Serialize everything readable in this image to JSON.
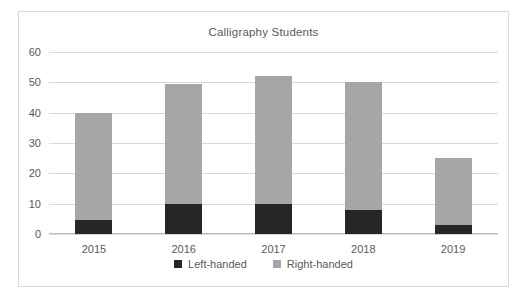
{
  "chart_data": {
    "type": "bar",
    "subtype": "stacked-column",
    "title": "Calligraphy Students",
    "xlabel": "",
    "ylabel": "",
    "categories": [
      "2015",
      "2016",
      "2017",
      "2018",
      "2019"
    ],
    "series": [
      {
        "name": "Left-handed",
        "values": [
          4.5,
          10,
          10,
          8,
          3
        ],
        "color": "#262626"
      },
      {
        "name": "Right-handed",
        "values": [
          35.5,
          39.5,
          42,
          42,
          22
        ],
        "color": "#a6a6a6"
      }
    ],
    "totals": [
      40,
      49.5,
      52,
      50,
      25
    ],
    "ylim": [
      0,
      60
    ],
    "yticks": [
      0,
      10,
      20,
      30,
      40,
      50,
      60
    ],
    "ytick_labels": [
      "0",
      "10",
      "20",
      "30",
      "40",
      "50",
      "60"
    ],
    "grid": true,
    "grid_axis": "y",
    "legend": true,
    "legend_position": "bottom",
    "legend_entries": [
      "Left-handed",
      "Right-handed"
    ]
  },
  "style": {
    "plot_background": "#ffffff",
    "frame_border": "#d9d9d9",
    "gridline_color": "#d9d9d9",
    "text_color": "#595959"
  }
}
